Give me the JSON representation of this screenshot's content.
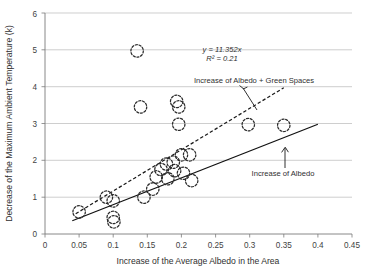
{
  "chart_data": {
    "type": "scatter",
    "title": "",
    "xlabel": "Increase of the Average Albedo in the Area",
    "ylabel": "Decrease of the Maximum Ambient Temperature (k)",
    "xlim": [
      0,
      0.45
    ],
    "ylim": [
      0,
      6
    ],
    "xticks": [
      "0",
      "0.05",
      "0.1",
      "0.15",
      "0.2",
      "0.25",
      "0.3",
      "0.35",
      "0.4",
      "0.45"
    ],
    "xtick_values": [
      0,
      0.05,
      0.1,
      0.15,
      0.2,
      0.25,
      0.3,
      0.35,
      0.4,
      0.45
    ],
    "yticks": [
      "0",
      "1",
      "2",
      "3",
      "4",
      "5",
      "6"
    ],
    "ytick_values": [
      0,
      1,
      2,
      3,
      4,
      5,
      6
    ],
    "grid": "horizontal",
    "legend": "none",
    "marker_style": "dashed-open-circle",
    "points": [
      {
        "x": 0.05,
        "y": 0.6
      },
      {
        "x": 0.09,
        "y": 1.0
      },
      {
        "x": 0.1,
        "y": 0.9
      },
      {
        "x": 0.1,
        "y": 0.45
      },
      {
        "x": 0.101,
        "y": 0.33
      },
      {
        "x": 0.135,
        "y": 4.97
      },
      {
        "x": 0.14,
        "y": 3.45
      },
      {
        "x": 0.145,
        "y": 1.0
      },
      {
        "x": 0.158,
        "y": 1.22
      },
      {
        "x": 0.163,
        "y": 1.55
      },
      {
        "x": 0.17,
        "y": 1.75
      },
      {
        "x": 0.178,
        "y": 1.9
      },
      {
        "x": 0.18,
        "y": 1.5
      },
      {
        "x": 0.188,
        "y": 1.95
      },
      {
        "x": 0.19,
        "y": 1.72
      },
      {
        "x": 0.193,
        "y": 3.6
      },
      {
        "x": 0.196,
        "y": 3.45
      },
      {
        "x": 0.196,
        "y": 2.98
      },
      {
        "x": 0.2,
        "y": 2.15
      },
      {
        "x": 0.203,
        "y": 1.65
      },
      {
        "x": 0.212,
        "y": 2.15
      },
      {
        "x": 0.215,
        "y": 1.45
      },
      {
        "x": 0.298,
        "y": 2.97
      },
      {
        "x": 0.35,
        "y": 2.95
      }
    ],
    "trendlines": [
      {
        "name": "Increase of Albedo + Green Spaces",
        "style": "dashed",
        "x0": 0.045,
        "y0": 0.55,
        "x1": 0.35,
        "y1": 3.97,
        "equation": "y = 11.352x",
        "r2": "R² = 0.21"
      },
      {
        "name": "Increase of Albedo",
        "style": "solid",
        "x0": 0.04,
        "y0": 0.36,
        "x1": 0.4,
        "y1": 2.98
      }
    ],
    "annotations": [
      {
        "name": "equation-label",
        "text": "y = 11.352x"
      },
      {
        "name": "r-squared-label",
        "text": "R² = 0.21"
      },
      {
        "name": "albedo-green-label",
        "text": "Increase of Albedo + Green Spaces"
      },
      {
        "name": "albedo-label",
        "text": "Increase of Albedo"
      }
    ]
  },
  "axes": {
    "x_title": "Increase of the Average Albedo in the Area",
    "y_title": "Decrease of the Maximum Ambient Temperature (k)",
    "x_labels": [
      "0",
      "0.05",
      "0.1",
      "0.15",
      "0.2",
      "0.25",
      "0.3",
      "0.35",
      "0.4",
      "0.45"
    ],
    "y_labels": [
      "0",
      "1",
      "2",
      "3",
      "4",
      "5",
      "6"
    ]
  },
  "annotations": {
    "equation": "y = 11.352x",
    "r_squared": "R² = 0.21",
    "series_dashed": "Increase of Albedo + Green Spaces",
    "series_solid": "Increase of Albedo"
  },
  "colors": {
    "marker_stroke": "#2b2b2b",
    "grid": "#b9b9b9",
    "axis": "#7b7b7b",
    "text": "#2f2f2f",
    "background": "#ffffff"
  },
  "footer": {
    "ghost_text": ""
  }
}
